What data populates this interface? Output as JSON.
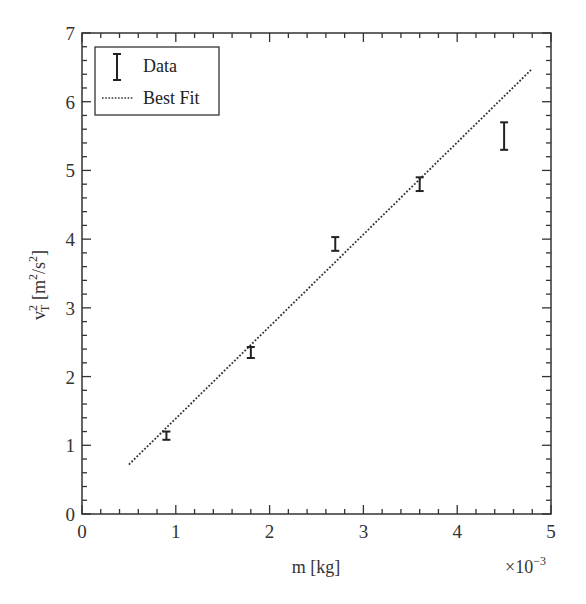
{
  "chart_data": {
    "type": "scatter",
    "title": "",
    "xlabel": "m [kg]",
    "ylabel": "v_T^2 [m^2/s^2]",
    "x_multiplier": "×10^-3",
    "xlim": [
      0,
      5
    ],
    "ylim": [
      0,
      7
    ],
    "x_ticks": [
      0,
      1,
      2,
      3,
      4,
      5
    ],
    "y_ticks": [
      0,
      1,
      2,
      3,
      4,
      5,
      6,
      7
    ],
    "x_minor_step": 0.2,
    "y_minor_step": 0.2,
    "grid": false,
    "legend_position": "upper left",
    "series": [
      {
        "name": "Data",
        "kind": "errorbar",
        "x": [
          0.9,
          1.8,
          2.7,
          3.6,
          4.5
        ],
        "y": [
          1.14,
          2.35,
          3.93,
          4.8,
          5.5
        ],
        "yerr": [
          0.06,
          0.08,
          0.1,
          0.1,
          0.2
        ]
      },
      {
        "name": "Best Fit",
        "kind": "line",
        "style": "dotted",
        "x": [
          0.5,
          4.8
        ],
        "y": [
          0.72,
          6.48
        ]
      }
    ]
  },
  "labels": {
    "xlabel_text": "m [kg]",
    "x_multiplier_base": "×10",
    "x_multiplier_exp": "−3",
    "ylabel_v": "v",
    "ylabel_sup": "2",
    "ylabel_sub": "T",
    "ylabel_unit_a": " [m",
    "ylabel_unit_sup1": "2",
    "ylabel_unit_b": "/s",
    "ylabel_unit_sup2": "2",
    "ylabel_unit_c": "]",
    "legend_data": "Data",
    "legend_fit": "Best Fit"
  },
  "colors": {
    "axis": "#333333",
    "data": "#222222",
    "fit": "#333333"
  }
}
